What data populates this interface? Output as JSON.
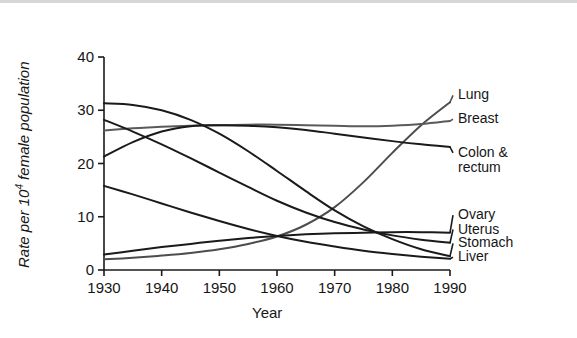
{
  "chart_data": {
    "type": "line",
    "title": "",
    "xlabel": "Year",
    "ylabel_text": "Rate per 10",
    "ylabel_sup": "4",
    "ylabel_tail": " female population",
    "xlim": [
      1930,
      1990
    ],
    "ylim": [
      0,
      40
    ],
    "xticks": [
      "1930",
      "1940",
      "1950",
      "1960",
      "1970",
      "1980",
      "1990"
    ],
    "xtick_values": [
      1930,
      1940,
      1950,
      1960,
      1970,
      1980,
      1990
    ],
    "yticks": [
      "0",
      "10",
      "20",
      "30",
      "40"
    ],
    "ytick_values": [
      0,
      10,
      20,
      30,
      40
    ],
    "grid": false,
    "legend_position": "right-inline-labels",
    "x": [
      1930,
      1935,
      1940,
      1945,
      1950,
      1955,
      1960,
      1965,
      1970,
      1975,
      1980,
      1985,
      1990
    ],
    "series": [
      {
        "name": "Lung",
        "label": "Lung",
        "color": "#4d4d4d",
        "values": [
          2.0,
          2.3,
          2.7,
          3.2,
          3.9,
          4.9,
          6.3,
          8.5,
          11.8,
          16.5,
          22.0,
          27.2,
          31.5
        ]
      },
      {
        "name": "Breast",
        "label": "Breast",
        "color": "#5a5a5a",
        "values": [
          26.2,
          26.6,
          26.9,
          27.1,
          27.2,
          27.3,
          27.3,
          27.2,
          27.1,
          27.0,
          27.1,
          27.4,
          28.0
        ]
      },
      {
        "name": "Colon & rectum",
        "label": "Colon & rectum",
        "color": "#1a1a1a",
        "values": [
          21.3,
          24.0,
          26.0,
          27.0,
          27.2,
          27.1,
          26.8,
          26.3,
          25.6,
          24.9,
          24.2,
          23.6,
          23.1
        ]
      },
      {
        "name": "Ovary",
        "label": "Ovary",
        "color": "#1a1a1a",
        "values": [
          2.9,
          3.6,
          4.3,
          4.9,
          5.5,
          6.0,
          6.4,
          6.7,
          6.9,
          7.0,
          7.1,
          7.1,
          7.0
        ]
      },
      {
        "name": "Uterus",
        "label": "Uterus",
        "color": "#1a1a1a",
        "values": [
          28.2,
          26.0,
          23.6,
          21.0,
          18.3,
          15.6,
          13.0,
          10.8,
          9.0,
          7.6,
          6.5,
          5.7,
          5.1
        ]
      },
      {
        "name": "Stomach",
        "label": "Stomach",
        "color": "#1a1a1a",
        "values": [
          31.3,
          31.0,
          30.0,
          28.2,
          25.6,
          22.3,
          18.6,
          14.8,
          11.2,
          8.2,
          5.8,
          3.9,
          2.6
        ]
      },
      {
        "name": "Liver",
        "label": "Liver",
        "color": "#1a1a1a",
        "values": [
          15.8,
          14.2,
          12.5,
          10.8,
          9.2,
          7.7,
          6.4,
          5.3,
          4.4,
          3.6,
          3.0,
          2.5,
          2.1
        ]
      }
    ],
    "series_labels_right": [
      {
        "name": "Lung",
        "text": "Lung",
        "y_value": 32.8
      },
      {
        "name": "Breast",
        "text": "Breast",
        "y_value": 28.3
      },
      {
        "name": "Colon & rectum",
        "text": "Colon &",
        "text2": "rectum",
        "y_value": 22.0
      },
      {
        "name": "Ovary",
        "text": "Ovary",
        "y_value": 10.3
      },
      {
        "name": "Uterus",
        "text": "Uterus",
        "y_value": 7.6
      },
      {
        "name": "Stomach",
        "text": "Stomach",
        "y_value": 5.0
      },
      {
        "name": "Liver",
        "text": "Liver",
        "y_value": 2.4
      }
    ]
  }
}
